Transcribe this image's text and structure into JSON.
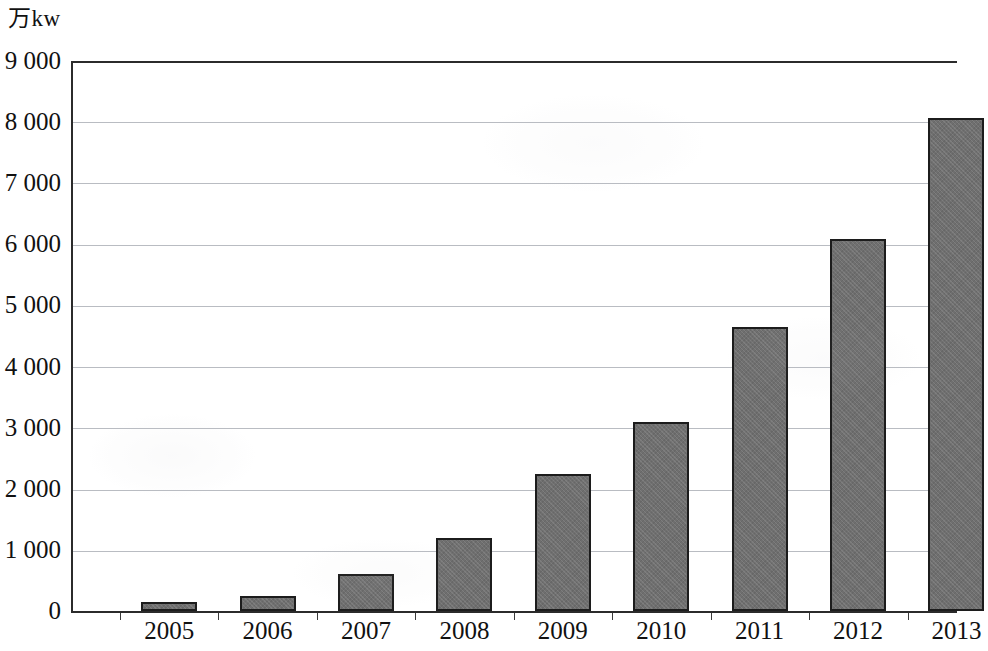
{
  "chart_data": {
    "type": "bar",
    "title": "",
    "subtitle": "",
    "xlabel": "",
    "ylabel": "万kw",
    "unit_caption": "万kw",
    "categories": [
      "2005",
      "2006",
      "2007",
      "2008",
      "2009",
      "2010",
      "2011",
      "2012",
      "2013"
    ],
    "values": [
      150,
      250,
      600,
      1190,
      2240,
      3090,
      4640,
      6080,
      8070
    ],
    "series": [
      {
        "name": "",
        "values": [
          150,
          250,
          600,
          1190,
          2240,
          3090,
          4640,
          6080,
          8070
        ]
      }
    ],
    "ylim": [
      0,
      9000
    ],
    "ytick_step": 1000,
    "ytick_labels": [
      "0",
      "1 000",
      "2 000",
      "3 000",
      "4 000",
      "5 000",
      "6 000",
      "7 000",
      "8 000",
      "9 000"
    ],
    "ytick_values": [
      0,
      1000,
      2000,
      3000,
      4000,
      5000,
      6000,
      7000,
      8000,
      9000
    ],
    "grid": true,
    "legend": false,
    "legend_position": "none",
    "bar_color": "#6f6f6f",
    "bar_outline_color": "#1c1c1c",
    "grid_color": "#b9bcc2",
    "axis_color": "#2b2b2b",
    "background_color": "#ffffff",
    "annotations": []
  }
}
